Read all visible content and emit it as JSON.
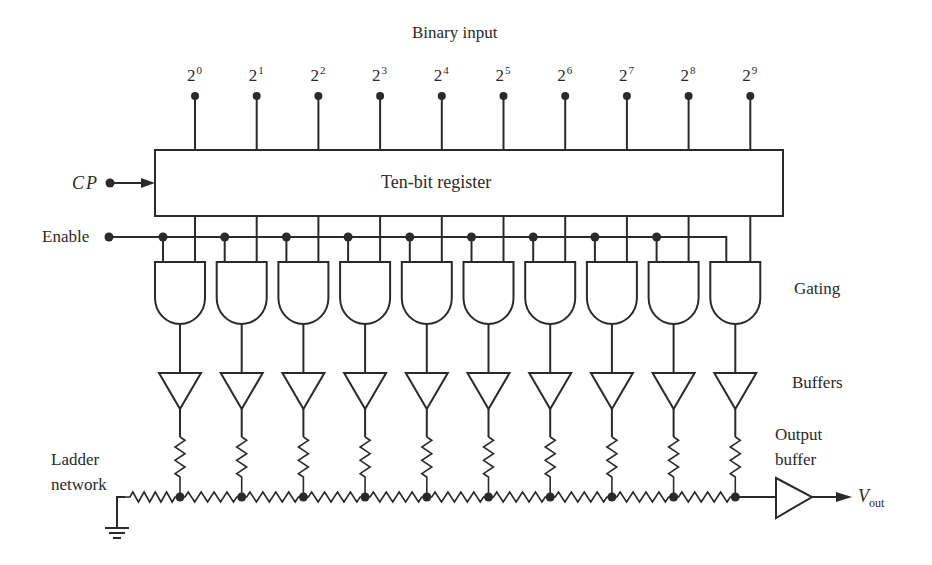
{
  "title": "Binary input",
  "register_label": "Ten-bit register",
  "clock_label": "CP",
  "enable_label": "Enable",
  "gating_label": "Gating",
  "buffers_label": "Buffers",
  "ladder_label_line1": "Ladder",
  "ladder_label_line2": "network",
  "output_buffer_line1": "Output",
  "output_buffer_line2": "buffer",
  "vout_label": "V",
  "vout_sub": "out",
  "bits": [
    {
      "base": "2",
      "exp": "0"
    },
    {
      "base": "2",
      "exp": "1"
    },
    {
      "base": "2",
      "exp": "2"
    },
    {
      "base": "2",
      "exp": "3"
    },
    {
      "base": "2",
      "exp": "4"
    },
    {
      "base": "2",
      "exp": "5"
    },
    {
      "base": "2",
      "exp": "6"
    },
    {
      "base": "2",
      "exp": "7"
    },
    {
      "base": "2",
      "exp": "8"
    },
    {
      "base": "2",
      "exp": "9"
    }
  ],
  "layout": {
    "bit_x0": 195,
    "bit_dx": 61.7,
    "enable_x0": 163,
    "register": {
      "x": 155,
      "y": 150,
      "w": 628,
      "h": 66
    },
    "enable_y": 237,
    "ladder_y": 497
  },
  "colors": {
    "ink": "#2a2a2a",
    "background": "#ffffff"
  }
}
